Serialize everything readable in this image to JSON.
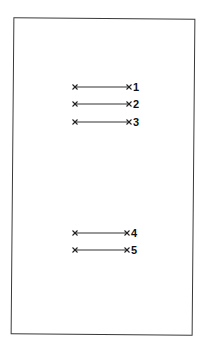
{
  "figure": {
    "frame": {
      "left": 12,
      "top": 18,
      "width": 182,
      "height": 317
    },
    "colors": {
      "line": "#333333",
      "marker": "#222222",
      "label": "#111111",
      "frame": "#3a3a3a",
      "background": "#ffffff"
    },
    "segments": [
      {
        "label": "1",
        "x1": 75,
        "x2": 129,
        "y": 87
      },
      {
        "label": "2",
        "x1": 75,
        "x2": 129,
        "y": 104
      },
      {
        "label": "3",
        "x1": 75,
        "x2": 129,
        "y": 122
      },
      {
        "label": "4",
        "x1": 75,
        "x2": 127,
        "y": 233
      },
      {
        "label": "5",
        "x1": 75,
        "x2": 127,
        "y": 250
      }
    ],
    "marker_icon": "cross-x-icon"
  }
}
